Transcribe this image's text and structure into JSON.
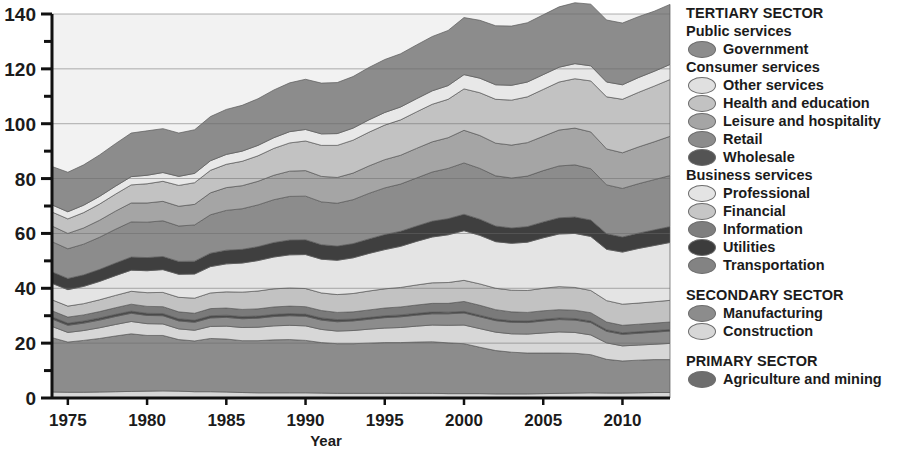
{
  "chart_data": {
    "type": "area",
    "title": "",
    "xlabel": "Year",
    "ylabel": "",
    "xlim": [
      1974,
      2013
    ],
    "ylim": [
      0,
      140
    ],
    "grid": true,
    "y_major_ticks": [
      0,
      20,
      40,
      60,
      80,
      100,
      120,
      140
    ],
    "y_minor_ticks": [
      10,
      30,
      50,
      70,
      90,
      110,
      130
    ],
    "x_tick_labels": [
      "1975",
      "1980",
      "1985",
      "1990",
      "1995",
      "2000",
      "2005",
      "2010"
    ],
    "x_ticks": [
      1975,
      1980,
      1985,
      1990,
      1995,
      2000,
      2005,
      2010
    ],
    "stack_order_bottom_to_top": [
      "Agriculture and mining",
      "Manufacturing",
      "Construction",
      "Transportation",
      "Utilities",
      "Information",
      "Financial",
      "Professional",
      "Wholesale",
      "Retail",
      "Leisure and hospitality",
      "Health and education",
      "Other services",
      "Government"
    ],
    "x": [
      1974,
      1975,
      1976,
      1977,
      1978,
      1979,
      1980,
      1981,
      1982,
      1983,
      1984,
      1985,
      1986,
      1987,
      1988,
      1989,
      1990,
      1991,
      1992,
      1993,
      1994,
      1995,
      1996,
      1997,
      1998,
      1999,
      2000,
      2001,
      2002,
      2003,
      2004,
      2005,
      2006,
      2007,
      2008,
      2009,
      2010,
      2011,
      2012,
      2013
    ],
    "series": [
      {
        "name": "Agriculture and mining",
        "color": "#d7d7d7",
        "values": [
          2.2,
          2.1,
          2.1,
          2.2,
          2.3,
          2.4,
          2.5,
          2.6,
          2.5,
          2.3,
          2.3,
          2.2,
          2.0,
          1.9,
          1.9,
          1.9,
          1.9,
          1.8,
          1.7,
          1.7,
          1.7,
          1.7,
          1.7,
          1.7,
          1.7,
          1.6,
          1.6,
          1.6,
          1.5,
          1.5,
          1.5,
          1.6,
          1.7,
          1.8,
          1.9,
          1.8,
          1.8,
          1.9,
          2.0,
          2.0
        ]
      },
      {
        "name": "Manufacturing",
        "color": "#8c8c8c",
        "values": [
          19.8,
          18.3,
          18.9,
          19.5,
          20.3,
          21.0,
          20.3,
          20.2,
          18.8,
          18.5,
          19.4,
          19.3,
          18.9,
          19.0,
          19.3,
          19.4,
          19.1,
          18.4,
          18.1,
          18.1,
          18.3,
          18.5,
          18.5,
          18.7,
          18.8,
          18.5,
          18.2,
          16.9,
          15.8,
          15.2,
          14.9,
          14.8,
          14.7,
          14.5,
          13.9,
          12.3,
          11.7,
          11.9,
          12.0,
          12.0
        ]
      },
      {
        "name": "Construction",
        "color": "#d7d7d7",
        "values": [
          4.1,
          3.5,
          3.6,
          3.9,
          4.2,
          4.5,
          4.3,
          4.2,
          3.9,
          3.9,
          4.4,
          4.7,
          4.8,
          4.9,
          5.1,
          5.2,
          5.3,
          4.8,
          4.6,
          4.8,
          5.1,
          5.3,
          5.5,
          5.8,
          6.1,
          6.4,
          6.8,
          6.8,
          6.7,
          6.7,
          6.9,
          7.3,
          7.7,
          7.6,
          7.2,
          6.0,
          5.5,
          5.5,
          5.6,
          5.9
        ]
      },
      {
        "name": "Transportation",
        "color": "#8c8c8c",
        "values": [
          2.7,
          2.6,
          2.7,
          2.8,
          2.9,
          3.0,
          3.0,
          3.0,
          2.9,
          2.9,
          3.1,
          3.2,
          3.2,
          3.3,
          3.4,
          3.5,
          3.5,
          3.4,
          3.4,
          3.5,
          3.6,
          3.8,
          3.9,
          4.0,
          4.1,
          4.2,
          4.4,
          4.3,
          4.2,
          4.2,
          4.2,
          4.4,
          4.5,
          4.5,
          4.5,
          4.2,
          4.2,
          4.3,
          4.4,
          4.5
        ]
      },
      {
        "name": "Utilities",
        "color": "#4a4a4a",
        "values": [
          0.8,
          0.8,
          0.8,
          0.8,
          0.8,
          0.8,
          0.8,
          0.8,
          0.8,
          0.8,
          0.8,
          0.8,
          0.8,
          0.8,
          0.8,
          0.8,
          0.8,
          0.8,
          0.8,
          0.7,
          0.7,
          0.7,
          0.7,
          0.7,
          0.7,
          0.6,
          0.6,
          0.6,
          0.6,
          0.6,
          0.6,
          0.6,
          0.6,
          0.6,
          0.6,
          0.6,
          0.6,
          0.6,
          0.6,
          0.6
        ]
      },
      {
        "name": "Information",
        "color": "#7a7a7a",
        "values": [
          2.2,
          2.2,
          2.2,
          2.3,
          2.4,
          2.5,
          2.5,
          2.5,
          2.5,
          2.5,
          2.6,
          2.6,
          2.6,
          2.6,
          2.7,
          2.7,
          2.7,
          2.7,
          2.6,
          2.6,
          2.7,
          2.8,
          2.9,
          3.0,
          3.1,
          3.2,
          3.6,
          3.6,
          3.4,
          3.2,
          3.1,
          3.1,
          3.0,
          3.0,
          3.0,
          2.8,
          2.7,
          2.7,
          2.7,
          2.7
        ]
      },
      {
        "name": "Financial",
        "color": "#c2c2c2",
        "values": [
          4.0,
          4.0,
          4.1,
          4.3,
          4.5,
          4.7,
          5.0,
          5.2,
          5.3,
          5.5,
          5.7,
          5.9,
          6.3,
          6.5,
          6.6,
          6.6,
          6.6,
          6.4,
          6.5,
          6.7,
          6.9,
          7.0,
          7.1,
          7.3,
          7.5,
          7.6,
          7.7,
          7.8,
          7.8,
          7.9,
          8.0,
          8.2,
          8.4,
          8.3,
          8.1,
          7.8,
          7.7,
          7.7,
          7.8,
          7.9
        ]
      },
      {
        "name": "Professional",
        "color": "#e4e4e4",
        "values": [
          6.0,
          6.0,
          6.3,
          6.7,
          7.2,
          7.7,
          8.0,
          8.3,
          8.4,
          8.8,
          9.6,
          10.2,
          10.6,
          11.1,
          11.6,
          12.1,
          12.4,
          12.3,
          12.5,
          13.0,
          13.7,
          14.3,
          15.0,
          15.9,
          16.7,
          17.4,
          18.1,
          17.7,
          17.0,
          17.1,
          17.6,
          18.4,
          19.2,
          19.7,
          19.7,
          18.7,
          19.0,
          19.9,
          20.5,
          21.1
        ]
      },
      {
        "name": "Wholesale",
        "color": "#3f3f3f",
        "values": [
          4.2,
          4.1,
          4.2,
          4.4,
          4.6,
          4.8,
          4.8,
          4.8,
          4.7,
          4.7,
          4.9,
          5.0,
          5.0,
          5.1,
          5.3,
          5.4,
          5.4,
          5.3,
          5.2,
          5.2,
          5.3,
          5.5,
          5.5,
          5.6,
          5.8,
          5.9,
          6.0,
          5.9,
          5.7,
          5.6,
          5.7,
          5.8,
          5.9,
          6.0,
          6.0,
          5.7,
          5.5,
          5.6,
          5.7,
          5.8
        ]
      },
      {
        "name": "Retail",
        "color": "#8c8c8c",
        "values": [
          11.0,
          10.8,
          11.2,
          11.7,
          12.3,
          12.8,
          12.9,
          13.0,
          12.9,
          13.2,
          14.0,
          14.5,
          14.8,
          15.2,
          15.6,
          15.9,
          15.9,
          15.6,
          15.6,
          16.0,
          16.6,
          17.0,
          17.2,
          17.5,
          17.9,
          18.3,
          18.7,
          18.5,
          18.3,
          18.2,
          18.4,
          18.7,
          18.9,
          19.0,
          18.7,
          17.8,
          17.7,
          18.0,
          18.3,
          18.6
        ]
      },
      {
        "name": "Leisure and hospitality",
        "color": "#a5a5a5",
        "values": [
          5.7,
          5.6,
          5.9,
          6.2,
          6.6,
          6.9,
          7.0,
          7.1,
          7.2,
          7.5,
          8.0,
          8.3,
          8.4,
          8.6,
          8.9,
          9.2,
          9.3,
          9.3,
          9.4,
          9.7,
          10.0,
          10.3,
          10.5,
          10.8,
          11.0,
          11.2,
          11.9,
          12.0,
          11.9,
          12.0,
          12.2,
          12.5,
          13.1,
          13.4,
          13.4,
          13.1,
          13.0,
          13.4,
          13.8,
          14.3
        ]
      },
      {
        "name": "Health and education",
        "color": "#c2c2c2",
        "values": [
          5.1,
          5.3,
          5.6,
          5.9,
          6.2,
          6.6,
          7.0,
          7.3,
          7.6,
          7.9,
          8.2,
          8.5,
          8.9,
          9.3,
          9.8,
          10.3,
          10.8,
          11.3,
          11.7,
          12.0,
          12.3,
          12.6,
          12.9,
          13.3,
          13.7,
          14.0,
          15.1,
          15.6,
          16.0,
          16.4,
          16.7,
          17.1,
          17.5,
          18.0,
          18.6,
          19.0,
          19.5,
          19.9,
          20.3,
          20.7
        ]
      },
      {
        "name": "Other services",
        "color": "#e8e8e8",
        "values": [
          2.6,
          2.6,
          2.7,
          2.8,
          2.9,
          3.0,
          3.1,
          3.2,
          3.3,
          3.4,
          3.5,
          3.6,
          3.7,
          3.8,
          3.9,
          4.1,
          4.2,
          4.2,
          4.3,
          4.4,
          4.5,
          4.6,
          4.7,
          4.8,
          4.9,
          5.0,
          5.2,
          5.3,
          5.3,
          5.4,
          5.4,
          5.4,
          5.4,
          5.5,
          5.5,
          5.4,
          5.3,
          5.4,
          5.4,
          5.5
        ]
      },
      {
        "name": "Government",
        "color": "#8c8c8c",
        "values": [
          14.0,
          14.4,
          14.7,
          15.1,
          15.5,
          15.9,
          16.2,
          16.0,
          15.8,
          15.9,
          16.1,
          16.4,
          16.7,
          17.0,
          17.4,
          17.8,
          18.3,
          18.5,
          18.6,
          18.8,
          19.1,
          19.3,
          19.4,
          19.6,
          19.8,
          20.1,
          20.8,
          21.1,
          21.5,
          21.6,
          21.6,
          21.8,
          22.0,
          22.2,
          22.5,
          22.6,
          22.5,
          22.2,
          21.9,
          21.9
        ]
      }
    ]
  },
  "legend": {
    "groups": [
      {
        "title": "TERTIARY SECTOR",
        "subgroups": [
          {
            "title": "Public services",
            "items": [
              {
                "label": "Government",
                "color": "#8c8c8c"
              }
            ]
          },
          {
            "title": "Consumer services",
            "items": [
              {
                "label": "Other services",
                "color": "#e0e0e0"
              },
              {
                "label": "Health and education",
                "color": "#c2c2c2"
              },
              {
                "label": "Leisure and hospitality",
                "color": "#a5a5a5"
              },
              {
                "label": "Retail",
                "color": "#8c8c8c"
              },
              {
                "label": "Wholesale",
                "color": "#545454"
              }
            ]
          },
          {
            "title": "Business services",
            "items": [
              {
                "label": "Professional",
                "color": "#e4e4e4"
              },
              {
                "label": "Financial",
                "color": "#c6c6c6"
              },
              {
                "label": "Information",
                "color": "#7e7e7e"
              },
              {
                "label": "Utilities",
                "color": "#3c3c3c"
              },
              {
                "label": "Transportation",
                "color": "#838383"
              }
            ]
          }
        ]
      },
      {
        "title": "SECONDARY SECTOR",
        "subgroups": [
          {
            "title": "",
            "items": [
              {
                "label": "Manufacturing",
                "color": "#8c8c8c"
              },
              {
                "label": "Construction",
                "color": "#d7d7d7"
              }
            ]
          }
        ]
      },
      {
        "title": "PRIMARY SECTOR",
        "subgroups": [
          {
            "title": "",
            "items": [
              {
                "label": "Agriculture and mining",
                "color": "#6e6e6e"
              }
            ]
          }
        ]
      }
    ]
  }
}
